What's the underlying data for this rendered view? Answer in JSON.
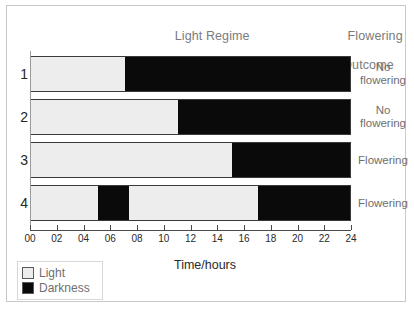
{
  "headers": {
    "regime_line1": "Light Regime",
    "regime_line2": "(Long Day Plants)",
    "outcome_line1": "Flowering",
    "outcome_line2": "Outcome"
  },
  "axis": {
    "title": "Time/hours",
    "min": 0,
    "max": 24,
    "tick_step": 2,
    "tick_labels": [
      "00",
      "02",
      "04",
      "06",
      "08",
      "10",
      "12",
      "14",
      "16",
      "18",
      "20",
      "22",
      "24"
    ]
  },
  "legend": {
    "items": [
      {
        "label": "Light",
        "color": "#ededed"
      },
      {
        "label": "Darkness",
        "color": "#0a0a0a"
      }
    ]
  },
  "colors": {
    "light": "#ededed",
    "dark": "#0a0a0a",
    "bar_border": "#3a3a3a",
    "header_text": "#7b7b7b",
    "frame": "#c9c9c9"
  },
  "chart_data": {
    "type": "bar",
    "title": "Light Regime (Long Day Plants)",
    "xlabel": "Time/hours",
    "ylabel": "",
    "xlim": [
      0,
      24
    ],
    "grid": false,
    "legend": [
      "Light",
      "Darkness"
    ],
    "categories": [
      "1",
      "2",
      "3",
      "4"
    ],
    "rows": [
      {
        "number": "1",
        "outcome": "No\nflowering",
        "segments": [
          {
            "type": "light",
            "start": 0,
            "end": 7
          },
          {
            "type": "dark",
            "start": 7,
            "end": 24
          }
        ]
      },
      {
        "number": "2",
        "outcome": "No\nflowering",
        "segments": [
          {
            "type": "light",
            "start": 0,
            "end": 11
          },
          {
            "type": "dark",
            "start": 11,
            "end": 24
          }
        ]
      },
      {
        "number": "3",
        "outcome": "Flowering",
        "segments": [
          {
            "type": "light",
            "start": 0,
            "end": 15
          },
          {
            "type": "dark",
            "start": 15,
            "end": 24
          }
        ]
      },
      {
        "number": "4",
        "outcome": "Flowering",
        "segments": [
          {
            "type": "light",
            "start": 0,
            "end": 5
          },
          {
            "type": "dark",
            "start": 5,
            "end": 7.3
          },
          {
            "type": "light",
            "start": 7.3,
            "end": 17
          },
          {
            "type": "dark",
            "start": 17,
            "end": 24
          }
        ]
      }
    ]
  }
}
